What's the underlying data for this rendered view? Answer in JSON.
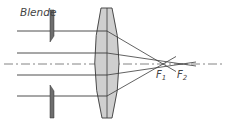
{
  "diagram": {
    "type": "optics-spherical-aberration",
    "labels": {
      "aperture": "Blende",
      "focus1": "F",
      "focus1_sub": "1",
      "focus2": "F",
      "focus2_sub": "2"
    },
    "colors": {
      "line": "#3a3a3a",
      "lens_fill": "#cfcfcf",
      "aperture_fill": "#6e6e6e",
      "axis": "#555555"
    }
  }
}
